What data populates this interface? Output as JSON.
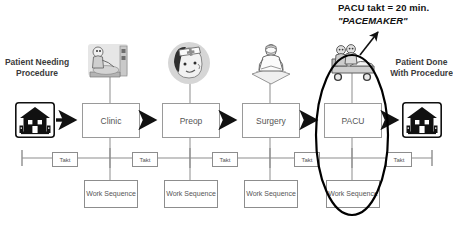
{
  "diagram": {
    "annotation": {
      "line1": "PACU takt = 20 min.",
      "line2": "\"PACEMAKER\"",
      "pointer_icon": "diagonal-arrow-icon"
    },
    "endpoints": {
      "start": {
        "label": "Patient Needing Procedure",
        "icon": "house-icon"
      },
      "end": {
        "label": "Patient Done With Procedure",
        "icon": "house-icon"
      }
    },
    "processes": [
      {
        "name": "Clinic",
        "illustration": "clinic-exam-icon",
        "work_sequence": "Work Sequence"
      },
      {
        "name": "Preop",
        "illustration": "nurse-portrait-icon",
        "work_sequence": "Work Sequence"
      },
      {
        "name": "Surgery",
        "illustration": "surgeon-icon",
        "work_sequence": "Work Sequence"
      },
      {
        "name": "PACU",
        "illustration": "gurney-patient-icon",
        "work_sequence": "Work Sequence"
      }
    ],
    "timeline": {
      "takt_label": "Takt",
      "takt_count": 5,
      "end_cap_icon": "timeline-endcap-icon"
    },
    "highlight": {
      "target": "PACU",
      "shape_icon": "ellipse-highlight-icon"
    },
    "flow_arrow_icon": "right-arrow-icon",
    "colors": {
      "ink": "#1c1c1c",
      "box_border": "#9a9a9a",
      "box_text": "#555555",
      "label_text": "#3b3b3b",
      "line": "#8d8d8d",
      "highlight": "#000000",
      "background": "#ffffff"
    }
  }
}
